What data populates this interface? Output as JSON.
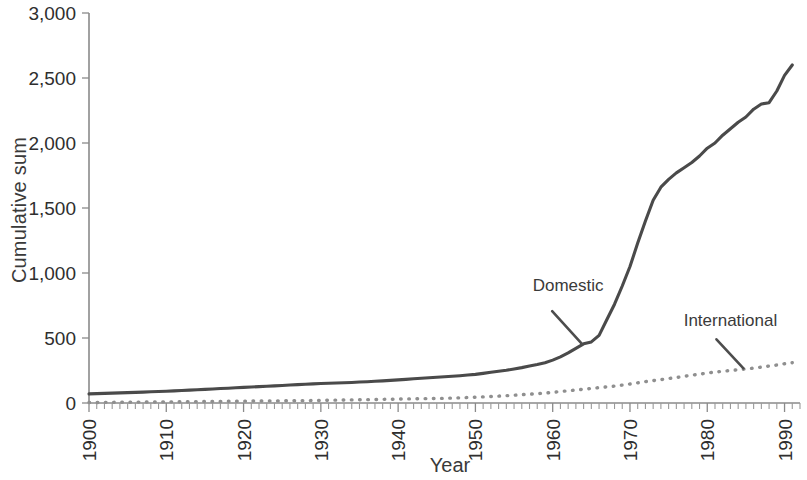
{
  "chart_data": {
    "type": "line",
    "title": "",
    "xlabel": "Year",
    "ylabel": "Cumulative sum",
    "xlim": [
      1900,
      1992
    ],
    "ylim": [
      0,
      3000
    ],
    "grid": false,
    "legend_position": "inline-annotations",
    "x_tick_labels": [
      "1900",
      "1910",
      "1920",
      "1930",
      "1940",
      "1950",
      "1960",
      "1970",
      "1980",
      "1990"
    ],
    "x_tick_values": [
      1900,
      1910,
      1920,
      1930,
      1940,
      1950,
      1960,
      1970,
      1980,
      1990
    ],
    "x_minor_tick_interval": 1,
    "y_tick_labels": [
      "0",
      "500",
      "1,000",
      "1,500",
      "2,000",
      "2,500",
      "3,000"
    ],
    "y_tick_values": [
      0,
      500,
      1000,
      1500,
      2000,
      2500,
      3000
    ],
    "annotations": [
      {
        "name": "domestic",
        "text": "Domestic",
        "x": 1962,
        "y": 860
      },
      {
        "name": "international",
        "text": "International",
        "x": 1983,
        "y": 590
      }
    ],
    "colors": {
      "domestic": "#4a4a4a",
      "international": "#8f8f8f",
      "axis": "#8a8a8a",
      "text": "#2e2e2e",
      "background": "#ffffff"
    },
    "series": [
      {
        "name": "Domestic",
        "style": "solid",
        "x": [
          1900,
          1901,
          1902,
          1903,
          1904,
          1905,
          1906,
          1907,
          1908,
          1909,
          1910,
          1911,
          1912,
          1913,
          1914,
          1915,
          1916,
          1917,
          1918,
          1919,
          1920,
          1921,
          1922,
          1923,
          1924,
          1925,
          1926,
          1927,
          1928,
          1929,
          1930,
          1931,
          1932,
          1933,
          1934,
          1935,
          1936,
          1937,
          1938,
          1939,
          1940,
          1941,
          1942,
          1943,
          1944,
          1945,
          1946,
          1947,
          1948,
          1949,
          1950,
          1951,
          1952,
          1953,
          1954,
          1955,
          1956,
          1957,
          1958,
          1959,
          1960,
          1961,
          1962,
          1963,
          1964,
          1965,
          1966,
          1967,
          1968,
          1969,
          1970,
          1971,
          1972,
          1973,
          1974,
          1975,
          1976,
          1977,
          1978,
          1979,
          1980,
          1981,
          1982,
          1983,
          1984,
          1985,
          1986,
          1987,
          1988,
          1989,
          1990,
          1991
        ],
        "values": [
          70,
          72,
          74,
          76,
          78,
          80,
          82,
          84,
          86,
          88,
          90,
          93,
          96,
          99,
          102,
          105,
          108,
          111,
          114,
          117,
          120,
          123,
          126,
          129,
          132,
          135,
          138,
          141,
          144,
          147,
          150,
          152,
          154,
          156,
          158,
          161,
          164,
          167,
          170,
          174,
          178,
          182,
          186,
          190,
          194,
          198,
          202,
          206,
          210,
          215,
          220,
          228,
          236,
          244,
          252,
          262,
          272,
          284,
          296,
          310,
          330,
          355,
          385,
          420,
          455,
          470,
          520,
          640,
          760,
          900,
          1050,
          1230,
          1400,
          1560,
          1660,
          1720,
          1770,
          1810,
          1850,
          1900,
          1960,
          2000,
          2060,
          2110,
          2160,
          2200,
          2260,
          2300,
          2310,
          2400,
          2520,
          2600
        ]
      },
      {
        "name": "International",
        "style": "dotted",
        "x": [
          1900,
          1901,
          1902,
          1903,
          1904,
          1905,
          1906,
          1907,
          1908,
          1909,
          1910,
          1911,
          1912,
          1913,
          1914,
          1915,
          1916,
          1917,
          1918,
          1919,
          1920,
          1921,
          1922,
          1923,
          1924,
          1925,
          1926,
          1927,
          1928,
          1929,
          1930,
          1931,
          1932,
          1933,
          1934,
          1935,
          1936,
          1937,
          1938,
          1939,
          1940,
          1941,
          1942,
          1943,
          1944,
          1945,
          1946,
          1947,
          1948,
          1949,
          1950,
          1951,
          1952,
          1953,
          1954,
          1955,
          1956,
          1957,
          1958,
          1959,
          1960,
          1961,
          1962,
          1963,
          1964,
          1965,
          1966,
          1967,
          1968,
          1969,
          1970,
          1971,
          1972,
          1973,
          1974,
          1975,
          1976,
          1977,
          1978,
          1979,
          1980,
          1981,
          1982,
          1983,
          1984,
          1985,
          1986,
          1987,
          1988,
          1989,
          1990,
          1991
        ],
        "values": [
          4,
          4,
          5,
          5,
          6,
          6,
          7,
          7,
          8,
          8,
          9,
          9,
          10,
          10,
          11,
          11,
          12,
          12,
          13,
          13,
          14,
          15,
          15,
          16,
          16,
          17,
          17,
          18,
          18,
          19,
          20,
          21,
          22,
          23,
          24,
          25,
          26,
          27,
          28,
          29,
          30,
          31,
          32,
          33,
          34,
          35,
          36,
          38,
          40,
          42,
          44,
          47,
          50,
          53,
          56,
          60,
          64,
          68,
          72,
          76,
          82,
          88,
          94,
          100,
          106,
          112,
          118,
          124,
          130,
          138,
          146,
          155,
          164,
          172,
          180,
          188,
          196,
          205,
          214,
          222,
          230,
          238,
          244,
          250,
          256,
          262,
          268,
          276,
          284,
          292,
          302,
          310
        ]
      }
    ]
  }
}
